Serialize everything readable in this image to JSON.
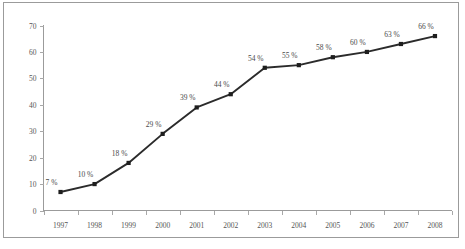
{
  "chart_data": {
    "type": "line",
    "title": "",
    "subtitle": "",
    "xlabel": "",
    "ylabel": "",
    "categories": [
      "1997",
      "1998",
      "1999",
      "2000",
      "2001",
      "2002",
      "2003",
      "2004",
      "2005",
      "2006",
      "2007",
      "2008"
    ],
    "values": [
      7,
      10,
      18,
      29,
      39,
      44,
      54,
      55,
      58,
      60,
      63,
      66
    ],
    "data_labels": [
      "7 %",
      "10 %",
      "18 %",
      "29 %",
      "39 %",
      "44 %",
      "54 %",
      "55 %",
      "58 %",
      "60 %",
      "63 %",
      "66 %"
    ],
    "ylim": [
      0,
      70
    ],
    "yticks": [
      0,
      10,
      20,
      30,
      40,
      50,
      60,
      70
    ],
    "ytick_labels": [
      "0",
      "10",
      "20",
      "30",
      "40",
      "50",
      "60",
      "70"
    ],
    "grid": false,
    "legend": null,
    "series": [
      {
        "name": "",
        "values": [
          7,
          10,
          18,
          29,
          39,
          44,
          54,
          55,
          58,
          60,
          63,
          66
        ],
        "marker": "square",
        "line_color": "#2b2b2b",
        "marker_color": "#1e1e1e"
      }
    ],
    "colors": {
      "line": "#2b2b2b",
      "marker": "#1e1e1e",
      "axis": "#9b9b9b",
      "tick_label": "#555555",
      "data_label": "#4a4a4a",
      "frame_border": "#9b9b9b",
      "background": "#ffffff"
    }
  }
}
